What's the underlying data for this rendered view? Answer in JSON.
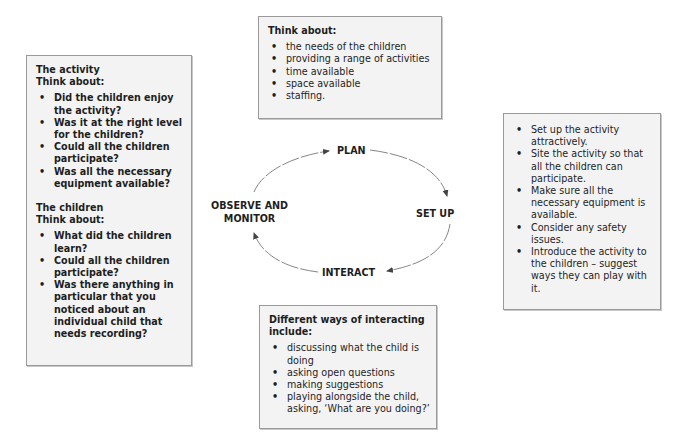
{
  "diagram": {
    "type": "cycle",
    "stages": {
      "plan": "PLAN",
      "setup": "SET UP",
      "interact": "INTERACT",
      "observe": [
        "OBSERVE AND",
        "MONITOR"
      ]
    },
    "flow": [
      "PLAN",
      "SET UP",
      "INTERACT",
      "OBSERVE AND MONITOR",
      "PLAN"
    ]
  },
  "plan_box": {
    "heading": "Think about:",
    "items": [
      "the needs of the children",
      "providing a range of activities",
      "time available",
      "space available",
      "staffing."
    ]
  },
  "setup_box": {
    "items": [
      "Set up the activity attractively.",
      "Site the activity so that all the children can participate.",
      "Make sure all the necessary equipment is available.",
      "Consider any safety issues.",
      "Introduce the activity to the children – suggest ways they can play with it."
    ]
  },
  "interact_box": {
    "heading": "Different ways of interacting include:",
    "items": [
      "discussing what the child is doing",
      "asking open questions",
      "making suggestions",
      "playing alongside the child, asking, ‘What are you doing?’"
    ]
  },
  "observe_box": {
    "activity": {
      "title": "The activity",
      "heading": "Think about:",
      "items": [
        "Did the children enjoy the activity?",
        "Was it at the right level for the children?",
        "Could all the children participate?",
        "Was all the necessary equipment available?"
      ]
    },
    "children": {
      "title": "The children",
      "heading": "Think about:",
      "items": [
        "What did the children learn?",
        "Could all the children participate?",
        "Was there anything in particular that you noticed about an individual child that needs recording?"
      ]
    }
  },
  "colors": {
    "box_bg": "#f3f3f3",
    "box_border": "#9a9a9a",
    "text": "#1e1e1e",
    "arrow": "#555555"
  }
}
